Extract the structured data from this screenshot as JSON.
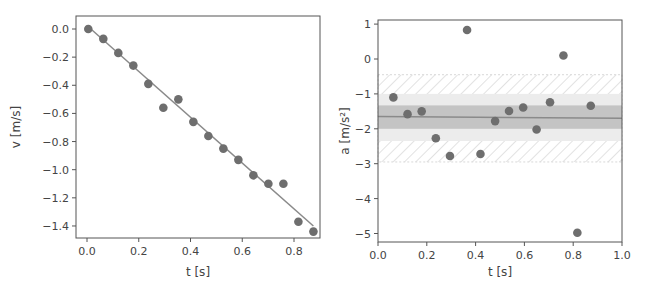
{
  "chart_data": [
    {
      "type": "scatter",
      "title": "",
      "xlabel": "t [s]",
      "ylabel": "v [m/s]",
      "xlim": [
        -0.04,
        0.9
      ],
      "ylim": [
        -1.5,
        0.05
      ],
      "xticks": [
        "0.0",
        "0.2",
        "0.4",
        "0.6",
        "0.8"
      ],
      "yticks": [
        "0.0",
        "−0.2",
        "−0.4",
        "−0.6",
        "−0.8",
        "−1.0",
        "−1.2",
        "−1.4"
      ],
      "grid": false,
      "series": [
        {
          "name": "measured velocity",
          "kind": "scatter",
          "x": [
            0.005,
            0.063,
            0.121,
            0.179,
            0.237,
            0.295,
            0.353,
            0.411,
            0.469,
            0.527,
            0.585,
            0.643,
            0.701,
            0.759,
            0.817,
            0.875
          ],
          "y": [
            0.0,
            -0.07,
            -0.17,
            -0.26,
            -0.39,
            -0.56,
            -0.5,
            -0.66,
            -0.76,
            -0.85,
            -0.93,
            -1.04,
            -1.1,
            -1.1,
            -1.37,
            -1.44
          ]
        },
        {
          "name": "linear fit",
          "kind": "line",
          "x": [
            0.015,
            0.875
          ],
          "y": [
            0.0,
            -1.4
          ]
        }
      ]
    },
    {
      "type": "scatter",
      "title": "",
      "xlabel": "t [s]",
      "ylabel": "a [m/s²]",
      "xlim": [
        0.0,
        1.0
      ],
      "ylim": [
        -5.2,
        1.1
      ],
      "xticks": [
        "0.0",
        "0.2",
        "0.4",
        "0.6",
        "0.8",
        "1.0"
      ],
      "yticks": [
        "1",
        "0",
        "−1",
        "−2",
        "−3",
        "−4",
        "−5"
      ],
      "grid": false,
      "bands": [
        {
          "name": "hatched band",
          "y0": -2.95,
          "y1": -0.45,
          "style": "hatched"
        },
        {
          "name": "light band",
          "y0": -2.35,
          "y1": -1.0,
          "style": "light-fill"
        },
        {
          "name": "dark band",
          "y0": -2.0,
          "y1": -1.33,
          "style": "dark-fill"
        }
      ],
      "series": [
        {
          "name": "measured acceleration",
          "kind": "scatter",
          "x": [
            0.063,
            0.121,
            0.179,
            0.237,
            0.295,
            0.365,
            0.42,
            0.48,
            0.537,
            0.595,
            0.65,
            0.705,
            0.76,
            0.817,
            0.872
          ],
          "y": [
            -1.1,
            -1.58,
            -1.5,
            -2.27,
            -2.78,
            0.83,
            -2.72,
            -1.78,
            -1.49,
            -1.39,
            -2.02,
            -1.24,
            0.1,
            -4.98,
            -1.34
          ]
        },
        {
          "name": "mean acceleration",
          "kind": "line",
          "x": [
            0.0,
            1.0
          ],
          "y": [
            -1.65,
            -1.7
          ]
        }
      ]
    }
  ],
  "colors": {
    "point": "#6e6e6e",
    "fit_line": "#8a8a8a",
    "axes": "#555555",
    "band_dark": "#c4c4c4",
    "band_light": "#ececec",
    "hatch": "#cfcfcf"
  }
}
